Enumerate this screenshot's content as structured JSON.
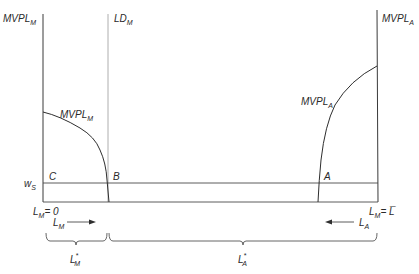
{
  "diagram": {
    "left_axis": {
      "label_main": "MVPL",
      "label_sub": "M"
    },
    "right_axis": {
      "label_main": "MVPL",
      "label_sub": "A"
    },
    "ld_line": {
      "label_main": "LD",
      "label_sub": "M"
    },
    "curve_m": {
      "label_main": "MVPL",
      "label_sub": "M"
    },
    "curve_a": {
      "label_main": "MVPL",
      "label_sub": "A"
    },
    "wage": {
      "label_main": "w",
      "label_sub": "S"
    },
    "points": {
      "c": "C",
      "b": "B",
      "a": "A"
    },
    "origin_left": {
      "label_main": "L",
      "label_sub": "M",
      "eq": "= 0"
    },
    "origin_right": {
      "label_main": "L",
      "label_sub": "M",
      "eq": "= L̅"
    },
    "arrow_m": {
      "label_main": "L",
      "label_sub": "M"
    },
    "arrow_a": {
      "label_main": "L",
      "label_sub": "A"
    },
    "brace_m": {
      "label_main": "L",
      "label_sub": "M",
      "sup": "*"
    },
    "brace_a": {
      "label_main": "L",
      "label_sub": "A",
      "sup": "*"
    },
    "colors": {
      "line": "#3a3a3a",
      "ld_line": "#9a9a9a",
      "background": "#ffffff"
    }
  }
}
